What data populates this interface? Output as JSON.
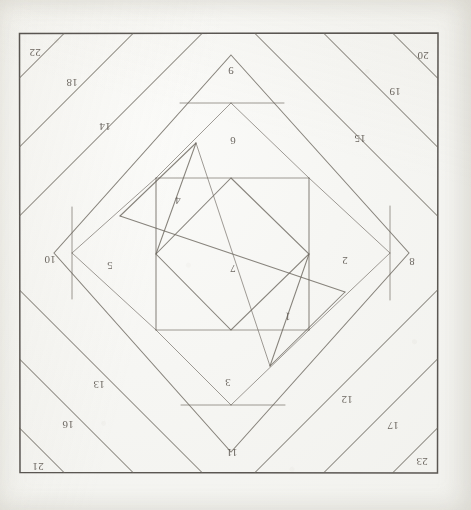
{
  "document": {
    "kind": "hand-drawn-quilt-block-draft",
    "medium": "pencil on aged paper",
    "background_color": "#f4f4f0",
    "ink_color": "#5a554d",
    "border_color": "#4d4944"
  },
  "frame": {
    "label": "outer-square-border",
    "left": 19,
    "top": 33,
    "right": 438,
    "bottom": 473
  },
  "pieces": [
    {
      "id": 1,
      "label": "1",
      "x": 288,
      "y": 313,
      "rotate": 182,
      "region": "center-inner-diamond-lower-right"
    },
    {
      "id": 2,
      "label": "2",
      "x": 345,
      "y": 257,
      "rotate": 180,
      "region": "center-right-parallelogram"
    },
    {
      "id": 3,
      "label": "3",
      "x": 228,
      "y": 379,
      "rotate": 180,
      "region": "center-bottom-rectangle"
    },
    {
      "id": 4,
      "label": "4",
      "x": 178,
      "y": 197,
      "rotate": 180,
      "region": "center-upper-left-parallelogram"
    },
    {
      "id": 5,
      "label": "5",
      "x": 110,
      "y": 262,
      "rotate": 180,
      "region": "center-left-rectangle"
    },
    {
      "id": 6,
      "label": "6",
      "x": 233,
      "y": 137,
      "rotate": 180,
      "region": "center-top-rectangle"
    },
    {
      "id": 7,
      "label": "7",
      "x": 233,
      "y": 265,
      "rotate": 180,
      "region": "center-core-square"
    },
    {
      "id": 8,
      "label": "8",
      "x": 412,
      "y": 258,
      "rotate": 180,
      "region": "right-corner-triangle"
    },
    {
      "id": 9,
      "label": "9",
      "x": 231,
      "y": 67,
      "rotate": 180,
      "region": "top-apex-triangle"
    },
    {
      "id": 10,
      "label": "10",
      "x": 50,
      "y": 256,
      "rotate": 180,
      "region": "left-corner-triangle"
    },
    {
      "id": 11,
      "label": "11",
      "x": 232,
      "y": 449,
      "rotate": 180,
      "region": "bottom-apex-triangle"
    },
    {
      "id": 12,
      "label": "12",
      "x": 347,
      "y": 396,
      "rotate": 180,
      "region": "bottom-right-inner-strip"
    },
    {
      "id": 13,
      "label": "13",
      "x": 99,
      "y": 381,
      "rotate": 180,
      "region": "bottom-left-inner-strip"
    },
    {
      "id": 14,
      "label": "14",
      "x": 105,
      "y": 123,
      "rotate": 180,
      "region": "top-left-inner-strip"
    },
    {
      "id": 15,
      "label": "15",
      "x": 360,
      "y": 135,
      "rotate": 180,
      "region": "top-right-inner-strip"
    },
    {
      "id": 16,
      "label": "16",
      "x": 68,
      "y": 421,
      "rotate": 180,
      "region": "bottom-left-middle-strip"
    },
    {
      "id": 17,
      "label": "17",
      "x": 393,
      "y": 422,
      "rotate": 180,
      "region": "bottom-right-middle-strip"
    },
    {
      "id": 18,
      "label": "18",
      "x": 72,
      "y": 79,
      "rotate": 180,
      "region": "top-left-middle-strip"
    },
    {
      "id": 19,
      "label": "19",
      "x": 395,
      "y": 88,
      "rotate": 180,
      "region": "top-right-middle-strip"
    },
    {
      "id": 20,
      "label": "20",
      "x": 423,
      "y": 52,
      "rotate": 180,
      "region": "top-right-corner-sliver"
    },
    {
      "id": 21,
      "label": "21",
      "x": 38,
      "y": 463,
      "rotate": 180,
      "region": "bottom-left-corner-sliver"
    },
    {
      "id": 22,
      "label": "22",
      "x": 35,
      "y": 49,
      "rotate": 180,
      "region": "top-left-corner-sliver"
    },
    {
      "id": 23,
      "label": "23",
      "x": 422,
      "y": 458,
      "rotate": 180,
      "region": "bottom-right-corner-sliver"
    }
  ],
  "geometry": {
    "border_strip_lines_note": "diagonal pencil rules running corner to corner forming concentric mitred border bands",
    "center_medallion_note": "on-point square medallion subdivided into rectangles and parallelograms"
  }
}
